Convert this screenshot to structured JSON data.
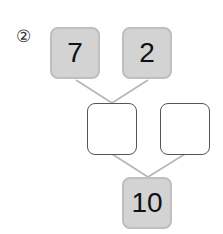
{
  "problem": {
    "number_label": "②",
    "top_left": "7",
    "top_right": "2",
    "middle_left": "",
    "middle_right": "",
    "bottom": "10"
  },
  "colors": {
    "filled_box": "#d3d3d3",
    "filled_border": "#bfbfbf",
    "line": "#b5b5b5"
  }
}
